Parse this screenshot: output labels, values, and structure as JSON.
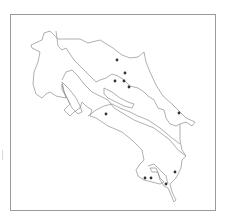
{
  "map": {
    "subject": "Costa Rica province outline map",
    "frame": {
      "x": 10,
      "y": 14,
      "width": 206,
      "height": 197,
      "border_color": "#9a9a9a"
    },
    "outline_color": "#8e8e8e",
    "point_color": "#333333",
    "points": [
      {
        "x": 117,
        "y": 60
      },
      {
        "x": 125,
        "y": 73
      },
      {
        "x": 115,
        "y": 81
      },
      {
        "x": 124,
        "y": 81
      },
      {
        "x": 129,
        "y": 87
      },
      {
        "x": 179,
        "y": 113
      },
      {
        "x": 106,
        "y": 114
      },
      {
        "x": 175,
        "y": 172
      },
      {
        "x": 145,
        "y": 178
      },
      {
        "x": 151,
        "y": 178
      },
      {
        "x": 166,
        "y": 184
      }
    ]
  }
}
